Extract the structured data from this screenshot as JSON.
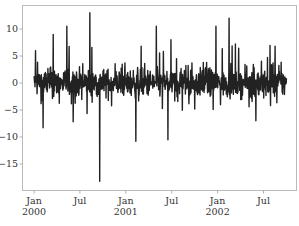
{
  "chart_data": {
    "type": "line",
    "title": "",
    "xlabel": "",
    "ylabel": "",
    "grid": false,
    "legend": null,
    "line_color": "#222222",
    "x_range": [
      "2000-01-01",
      "2002-10-01"
    ],
    "ylim": [
      -19.8,
      14.5
    ],
    "y_ticks": [
      10,
      5,
      0,
      -5,
      -10,
      -15
    ],
    "y_tick_labels": [
      "10",
      "5",
      "0",
      "−5",
      "−10",
      "−15"
    ],
    "x_ticks": [
      {
        "label_top": "Jan",
        "label_bottom": "2000",
        "month_index": 0
      },
      {
        "label_top": "Jul",
        "label_bottom": "",
        "month_index": 6
      },
      {
        "label_top": "Jan",
        "label_bottom": "2001",
        "month_index": 12
      },
      {
        "label_top": "Jul",
        "label_bottom": "",
        "month_index": 18
      },
      {
        "label_top": "Jan",
        "label_bottom": "2002",
        "month_index": 24
      },
      {
        "label_top": "Jul",
        "label_bottom": "",
        "month_index": 30
      }
    ],
    "series": [
      {
        "name": "value",
        "start_month_index": 0,
        "end_month_index": 33,
        "n_points": 1000,
        "typical_range": [
          -8,
          8
        ],
        "notable_points": [
          {
            "month_index": 0.2,
            "value": 6.0
          },
          {
            "month_index": 1.2,
            "value": -8.3
          },
          {
            "month_index": 2.5,
            "value": 9.0
          },
          {
            "month_index": 4.3,
            "value": 10.5
          },
          {
            "month_index": 7.3,
            "value": 13.0
          },
          {
            "month_index": 8.6,
            "value": -18.2
          },
          {
            "month_index": 13.3,
            "value": -10.8
          },
          {
            "month_index": 16.0,
            "value": 10.5
          },
          {
            "month_index": 17.5,
            "value": -10.5
          },
          {
            "month_index": 23.8,
            "value": 10.5
          },
          {
            "month_index": 25.5,
            "value": 12.0
          },
          {
            "month_index": 29.0,
            "value": -7.0
          },
          {
            "month_index": 31.5,
            "value": 6.8
          }
        ]
      }
    ]
  }
}
